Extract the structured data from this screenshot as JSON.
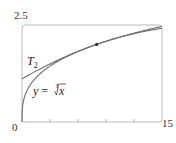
{
  "chart_data": {
    "type": "line",
    "title": "",
    "xlabel": "",
    "ylabel": "",
    "xlim": [
      0,
      15
    ],
    "ylim": [
      0,
      2.5
    ],
    "x_tick_labels": [
      "0",
      "15"
    ],
    "y_tick_labels": [
      "2.5"
    ],
    "x_minor_ticks": [
      3,
      6,
      9,
      12
    ],
    "grid": false,
    "legend": "none (inline curve labels)",
    "series": [
      {
        "name": "y = ∛x",
        "function": "x^(1/3)",
        "x": [
          0,
          0.5,
          1,
          2,
          3,
          4,
          6,
          8,
          10,
          12,
          15
        ],
        "y": [
          0,
          0.794,
          1.0,
          1.26,
          1.442,
          1.587,
          1.817,
          2.0,
          2.154,
          2.289,
          2.466
        ]
      },
      {
        "name": "T₂",
        "function": "2 + (x-8)/12 - (x-8)^2/288",
        "x": [
          0,
          2,
          4,
          6,
          8,
          10,
          12,
          15
        ],
        "y": [
          1.111,
          1.375,
          1.611,
          1.819,
          2.0,
          2.153,
          2.278,
          2.413
        ]
      }
    ],
    "annotations": [
      {
        "type": "point",
        "x": 8,
        "y": 2,
        "label": ""
      }
    ]
  },
  "labels": {
    "y_max": "2.5",
    "x_min": "0",
    "x_max": "15",
    "t2_main": "T",
    "t2_sub": "2",
    "curve_y": "y",
    "curve_eq": " = ",
    "curve_root_index": "3",
    "curve_x": "x"
  },
  "colors": {
    "frame": "#b0b0b0",
    "curve": "#6a6a6a",
    "point": "#333333"
  }
}
